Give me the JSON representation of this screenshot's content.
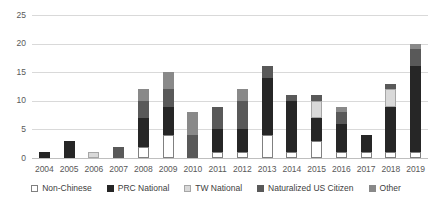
{
  "chart_data": {
    "type": "bar",
    "stacked": true,
    "title": "",
    "xlabel": "",
    "ylabel": "",
    "ylim": [
      0,
      25
    ],
    "yticks": [
      0,
      5,
      10,
      15,
      20,
      25
    ],
    "grid": true,
    "legend_position": "bottom",
    "categories": [
      "2004",
      "2005",
      "2006",
      "2007",
      "2008",
      "2009",
      "2010",
      "2011",
      "2012",
      "2013",
      "2014",
      "2015",
      "2016",
      "2017",
      "2018",
      "2019"
    ],
    "series": [
      {
        "name": "Non-Chinese",
        "color": "#ffffff",
        "border": "#808080",
        "values": [
          0,
          0,
          0,
          0,
          2,
          4,
          0,
          1,
          1,
          4,
          1,
          3,
          1,
          1,
          1,
          1
        ]
      },
      {
        "name": "PRC National",
        "color": "#262626",
        "border": "#262626",
        "values": [
          1,
          3,
          0,
          0,
          5,
          5,
          0,
          4,
          4,
          10,
          9,
          4,
          5,
          3,
          8,
          15
        ]
      },
      {
        "name": "TW National",
        "color": "#d9d9d9",
        "border": "#a6a6a6",
        "values": [
          0,
          0,
          1,
          0,
          0,
          0,
          0,
          0,
          0,
          0,
          0,
          3,
          0,
          0,
          3,
          0
        ]
      },
      {
        "name": "Naturalized US Citizen",
        "color": "#595959",
        "border": "#595959",
        "values": [
          0,
          0,
          0,
          2,
          3,
          3,
          4,
          4,
          5,
          2,
          1,
          1,
          2,
          0,
          1,
          3
        ]
      },
      {
        "name": "Other",
        "color": "#898989",
        "border": "#898989",
        "values": [
          0,
          0,
          0,
          0,
          2,
          3,
          4,
          0,
          2,
          0,
          0,
          0,
          1,
          0,
          0,
          1
        ]
      }
    ],
    "totals": [
      1,
      3,
      1,
      2,
      12,
      15,
      8,
      9,
      12,
      16,
      11,
      11,
      9,
      4,
      13,
      20
    ]
  },
  "colors": {
    "background": "#ffffff",
    "gridline": "#d9d9d9",
    "axis_line": "#bfbfbf",
    "tick_text": "#595959",
    "legend_text": "#404040"
  }
}
